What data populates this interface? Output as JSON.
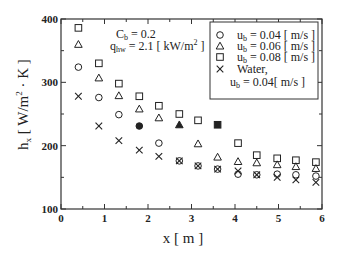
{
  "chart_data": {
    "type": "scatter",
    "title": "",
    "xlabel": "x [ m ]",
    "ylabel": "h_x [ W/m^2 · K ]",
    "xlim": [
      0,
      6
    ],
    "ylim": [
      100,
      400
    ],
    "x_ticks": [
      0,
      1,
      2,
      3,
      4,
      5,
      6
    ],
    "y_ticks": [
      100,
      200,
      300,
      400
    ],
    "grid": false,
    "legend_position": "upper right (boxed)",
    "annotations": [
      "C_b = 0.2",
      "q_hw = 2.1 [ kW/m^2 ]"
    ],
    "series": [
      {
        "name": "u_b = 0.04 [ m/s ]",
        "marker": "circle",
        "x": [
          0.4,
          0.87,
          1.33,
          1.8,
          2.25,
          2.72,
          3.15,
          3.6,
          4.07,
          4.5,
          4.97,
          5.4,
          5.86
        ],
        "y": [
          324,
          276,
          249,
          231,
          204,
          176,
          168,
          163,
          155,
          154,
          155,
          154,
          152
        ],
        "filled_indices": [
          3
        ]
      },
      {
        "name": "u_b = 0.06 [ m/s ]",
        "marker": "triangle",
        "x": [
          0.4,
          0.87,
          1.33,
          1.8,
          2.25,
          2.72,
          3.15,
          3.6,
          4.07,
          4.5,
          4.97,
          5.4,
          5.86
        ],
        "y": [
          360,
          307,
          279,
          258,
          244,
          233,
          203,
          182,
          175,
          173,
          170,
          167,
          164
        ],
        "filled_indices": [
          5
        ]
      },
      {
        "name": "u_b = 0.08 [ m/s ]",
        "marker": "square",
        "x": [
          0.4,
          0.87,
          1.33,
          1.8,
          2.25,
          2.72,
          3.15,
          3.6,
          4.07,
          4.5,
          4.97,
          5.4,
          5.86
        ],
        "y": [
          386,
          330,
          298,
          278,
          263,
          250,
          240,
          233,
          204,
          185,
          180,
          177,
          174
        ],
        "filled_indices": [
          7
        ]
      },
      {
        "name": "Water, u_b = 0.04[ m/s ]",
        "marker": "x",
        "x": [
          0.4,
          0.87,
          1.33,
          1.8,
          2.25,
          2.72,
          3.15,
          3.6,
          4.07,
          4.5,
          4.97,
          5.4,
          5.86
        ],
        "y": [
          278,
          231,
          208,
          193,
          183,
          176,
          168,
          163,
          160,
          154,
          150,
          146,
          142
        ],
        "filled_indices": []
      }
    ]
  },
  "labels": {
    "y_axis_main": "h",
    "y_axis_sub": "x",
    "y_axis_rest": " [ W/m",
    "y_axis_sup": "2",
    "y_axis_end": " · K ]",
    "x_axis": "x [ m ]",
    "ann_c_main": "C",
    "ann_c_sub": "b",
    "ann_c_rest": " = 0.2",
    "ann_q_main": "q",
    "ann_q_sub": "hw",
    "ann_q_rest": " = 2.1 [ kW/m",
    "ann_q_sup": "2",
    "ann_q_end": " ]",
    "legend": [
      {
        "marker": "circle",
        "main": "u",
        "sub": "b",
        "rest": " = 0.04 [ m/s ]"
      },
      {
        "marker": "triangle",
        "main": "u",
        "sub": "b",
        "rest": " = 0.06 [ m/s ]"
      },
      {
        "marker": "square",
        "main": "u",
        "sub": "b",
        "rest": " = 0.08 [ m/s ]"
      },
      {
        "marker": "x",
        "main": "Water,",
        "sub": "",
        "rest": ""
      }
    ],
    "legend_extra": {
      "main": "u",
      "sub": "b",
      "rest": " = 0.04[ m/s ]"
    }
  },
  "colors": {
    "ink": "#222222",
    "background": "#ffffff"
  }
}
